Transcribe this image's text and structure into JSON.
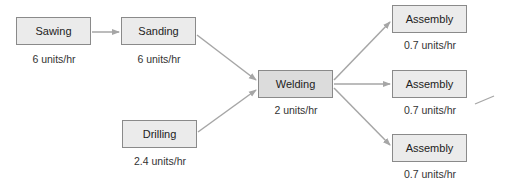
{
  "colors": {
    "box_fill": "#ebebeb",
    "box_fill_highlight": "#dcdcdc",
    "box_border": "#8a8a8a",
    "arrow": "#a6a6a6",
    "text": "#222222"
  },
  "nodes": [
    {
      "id": "sawing",
      "label": "Sawing",
      "rate": "6 units/hr",
      "x": 16,
      "y": 17
    },
    {
      "id": "sanding",
      "label": "Sanding",
      "rate": "6 units/hr",
      "x": 121,
      "y": 17
    },
    {
      "id": "drilling",
      "label": "Drilling",
      "rate": "2.4 units/hr",
      "x": 122,
      "y": 120
    },
    {
      "id": "welding",
      "label": "Welding",
      "rate": "2 units/hr",
      "x": 258,
      "y": 70
    },
    {
      "id": "assembly1",
      "label": "Assembly",
      "rate": "0.7 units/hr",
      "x": 392,
      "y": 5
    },
    {
      "id": "assembly2",
      "label": "Assembly",
      "rate": "0.7 units/hr",
      "x": 392,
      "y": 70
    },
    {
      "id": "assembly3",
      "label": "Assembly",
      "rate": "0.7 units/hr",
      "x": 392,
      "y": 134
    }
  ],
  "edges": [
    {
      "from": "sawing",
      "to": "sanding"
    },
    {
      "from": "sanding",
      "to": "welding"
    },
    {
      "from": "drilling",
      "to": "welding"
    },
    {
      "from": "welding",
      "to": "assembly1"
    },
    {
      "from": "welding",
      "to": "assembly2"
    },
    {
      "from": "welding",
      "to": "assembly3"
    }
  ]
}
